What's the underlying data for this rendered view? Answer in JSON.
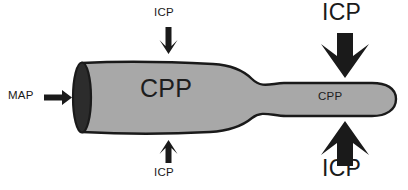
{
  "figure": {
    "background_color": "#ffffff",
    "vessel_fill_color": "#a8a8a8",
    "vessel_outline_color": "#1a1a1a",
    "vessel_opening_color": "#2c2c2c",
    "arrow_color": "#1a1a1a",
    "text_color": "#1a1a1a"
  },
  "labels": {
    "map": "MAP",
    "cpp_body": "CPP",
    "cpp_neck": "CPP",
    "icp_top_left": "ICP",
    "icp_bottom_left": "ICP",
    "icp_top_right": "ICP",
    "icp_bottom_right": "ICP"
  },
  "icons": {
    "map_arrow": "arrow-right-icon",
    "icp_top_left_arrow": "arrow-down-icon",
    "icp_bottom_left_arrow": "arrow-up-icon",
    "icp_top_right_arrow": "arrow-down-icon",
    "icp_bottom_right_arrow": "arrow-up-icon"
  }
}
